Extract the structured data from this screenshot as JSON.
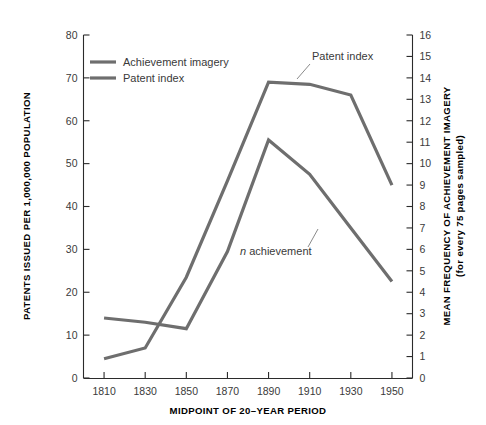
{
  "chart_data": {
    "type": "line",
    "title": "",
    "subtitle": "",
    "xlabel": "MIDPOINT OF 20–YEAR PERIOD",
    "ylabel": "PATENTS ISSUED PER 1,000,000 POPULATION",
    "ylabel_right_line1": "MEAN FREQUENCY OF ACHIEVEMENT IMAGERY",
    "ylabel_right_line2": "(for every 75 pages sampled)",
    "x": [
      1810,
      1830,
      1850,
      1870,
      1890,
      1910,
      1930,
      1950
    ],
    "categories": [
      "1810",
      "1830",
      "1850",
      "1870",
      "1890",
      "1910",
      "1930",
      "1950"
    ],
    "xlim": [
      1800,
      1960
    ],
    "xticks": [
      1810,
      1830,
      1850,
      1870,
      1890,
      1910,
      1930,
      1950
    ],
    "ylim": [
      0,
      80
    ],
    "yticks": [
      0,
      10,
      20,
      30,
      40,
      50,
      60,
      70,
      80
    ],
    "yticklabels": [
      "0",
      "10",
      "20",
      "30",
      "40",
      "50",
      "60",
      "70",
      "80"
    ],
    "ylim_right": [
      0,
      16
    ],
    "yticks_right": [
      0,
      1,
      2,
      3,
      4,
      5,
      6,
      7,
      8,
      9,
      10,
      11,
      12,
      13,
      14,
      15,
      16
    ],
    "yticklabels_right": [
      "0",
      "1",
      "2",
      "3",
      "4",
      "5",
      "6",
      "7",
      "8",
      "9",
      "10",
      "11",
      "12",
      "13",
      "14",
      "15",
      "16"
    ],
    "grid": false,
    "legend_position": "upper-left-inside",
    "series": [
      {
        "name": "Achievement imagery",
        "axis": "right",
        "color": "#6e6e6e",
        "values": [
          2.8,
          2.6,
          2.3,
          5.9,
          11.1,
          9.5,
          7.0,
          4.5
        ],
        "values_left_scale": [
          14.0,
          13.0,
          11.5,
          29.5,
          55.5,
          47.5,
          35.0,
          22.5
        ]
      },
      {
        "name": "Patent index",
        "axis": "left",
        "color": "#6e6e6e",
        "values": [
          4.5,
          7.0,
          23.5,
          46.0,
          69.0,
          68.5,
          66.0,
          45.0
        ]
      }
    ],
    "annotations": [
      {
        "text": "Patent index",
        "x": 1910,
        "y": 72.5
      },
      {
        "text": "n achievement",
        "italic_prefix": "n",
        "rest": " achievement",
        "x": 1883,
        "y": 36.0
      }
    ]
  },
  "legend": {
    "items": [
      {
        "label": "Achievement imagery",
        "color": "#6e6e6e"
      },
      {
        "label": "Patent index",
        "color": "#6e6e6e"
      }
    ]
  },
  "colors": {
    "line": "#6e6e6e",
    "axis": "#2b2b2b",
    "tick_text": "#3a3a3a",
    "title_text": "#000000",
    "background": "#ffffff"
  }
}
